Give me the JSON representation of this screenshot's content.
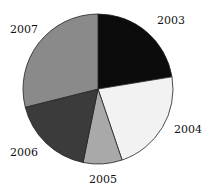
{
  "chart_data": {
    "type": "pie",
    "title": "",
    "categories": [
      "2003",
      "2004",
      "2005",
      "2006",
      "2007"
    ],
    "values": [
      22.4,
      22.4,
      8.4,
      17.9,
      28.9
    ],
    "unit": "percent (estimated from slice angles)",
    "colors": [
      "#0c0c0c",
      "#f2f2f2",
      "#a9a9a9",
      "#3b3b3b",
      "#8a8a8a"
    ],
    "start_angle": "12 o'clock",
    "direction": "clockwise",
    "legend": "none (direct labels)",
    "labels": [
      {
        "text": "2003",
        "x": 171,
        "y": 24
      },
      {
        "text": "2004",
        "x": 188,
        "y": 133
      },
      {
        "text": "2005",
        "x": 103,
        "y": 183
      },
      {
        "text": "2006",
        "x": 24,
        "y": 156
      },
      {
        "text": "2007",
        "x": 24,
        "y": 33
      }
    ]
  }
}
